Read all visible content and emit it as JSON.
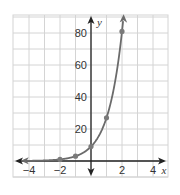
{
  "chart_data": {
    "type": "line",
    "title": "",
    "xlabel": "x",
    "ylabel": "y",
    "xlim": [
      -4.5,
      4.5
    ],
    "ylim": [
      -8,
      92
    ],
    "grid": true,
    "x_grid_step": 1,
    "y_grid_step": 10,
    "x_ticks": [
      -4,
      -2,
      2,
      4
    ],
    "x_tick_labels": [
      "−4",
      "−2",
      "2",
      "4"
    ],
    "y_ticks": [
      20,
      40,
      60,
      80
    ],
    "y_tick_labels": [
      "20",
      "40",
      "60",
      "80"
    ],
    "function": "y = 9·3^x",
    "points": [
      {
        "x": -2,
        "y": 1
      },
      {
        "x": -1,
        "y": 3
      },
      {
        "x": 0,
        "y": 9
      },
      {
        "x": 1,
        "y": 27
      },
      {
        "x": 2,
        "y": 81
      }
    ],
    "colors": {
      "curve": "#6b6b6b",
      "points": "#7a7a7a",
      "axes": "#222222",
      "grid": "#d4d4d4"
    }
  }
}
